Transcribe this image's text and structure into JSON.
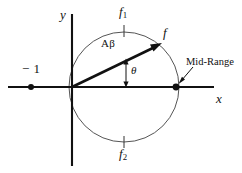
{
  "figure": {
    "type": "vector-phasor-diagram",
    "width": 242,
    "height": 173,
    "background_color": "#ffffff",
    "ink_color": "#111111",
    "circle_stroke_color": "#555555"
  },
  "axes": {
    "x_label": "x",
    "y_label": "y",
    "origin": {
      "x": 72,
      "y": 87
    },
    "x_axis": {
      "start_x": 8,
      "end_x": 214,
      "y": 87
    },
    "y_axis": {
      "x": 72,
      "start_y": 14,
      "end_y": 166
    }
  },
  "circle": {
    "center": {
      "x": 124,
      "y": 87
    },
    "radius": 55,
    "description": "circle tangent to the y-axis at the origin"
  },
  "points": [
    {
      "name": "minus-one-point",
      "label": "− 1",
      "x": 31,
      "y": 87,
      "marker": "filled-dot"
    },
    {
      "name": "mid-range-point",
      "label": "Mid-Range",
      "x": 176,
      "y": 87,
      "marker": "filled-dot"
    }
  ],
  "ticks": [
    {
      "name": "f1-tick",
      "label": "f",
      "subscript": "1",
      "x": 124,
      "y": 31,
      "position": "top-of-circle"
    },
    {
      "name": "f2-tick",
      "label": "f",
      "subscript": "2",
      "x": 124,
      "y": 142,
      "position": "bottom-of-circle"
    }
  ],
  "vector": {
    "name": "f-vector",
    "label": "f",
    "magnitude_label": "Aβ",
    "angle_label": "θ",
    "from": {
      "x": 72,
      "y": 87
    },
    "to": {
      "x": 161,
      "y": 44
    }
  },
  "annotations": [
    {
      "name": "mid-range-annotation",
      "text": "Mid-Range",
      "arrow_from": {
        "x": 192,
        "y": 68
      },
      "arrow_to": {
        "x": 179,
        "y": 83
      }
    }
  ],
  "labels": {
    "y_axis": "y",
    "x_axis": "x",
    "f_vector": "f",
    "f_one": "f",
    "f_one_sub": "1",
    "f_two": "f",
    "f_two_sub": "2",
    "amplitude": "Aβ",
    "theta": "θ",
    "minus_one": "− 1",
    "mid_range": "Mid-Range"
  }
}
